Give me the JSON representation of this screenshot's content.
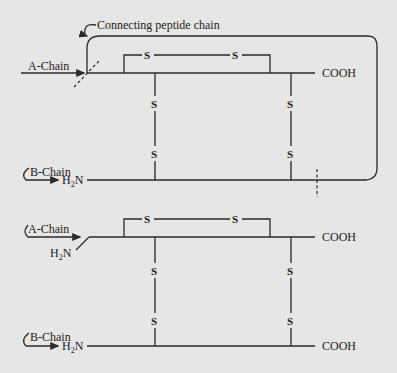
{
  "diagram": {
    "colors": {
      "background": "#e6e6e4",
      "ink": "#2a2a2a"
    },
    "top": {
      "connecting_label": "Connecting peptide chain",
      "a_chain_label": "A-Chain",
      "b_chain_label": "B-Chain",
      "a_chain_end": "COOH",
      "b_chain_start_h": "H",
      "b_chain_start_sub": "2",
      "b_chain_start_n": "N",
      "intra_s1": "S",
      "intra_s2": "S",
      "inter_left_top": "S",
      "inter_left_bottom": "S",
      "inter_right_top": "S",
      "inter_right_bottom": "S"
    },
    "bottom": {
      "a_chain_label": "A-Chain",
      "b_chain_label": "B-Chain",
      "a_chain_start_h": "H",
      "a_chain_start_sub": "2",
      "a_chain_start_n": "N",
      "a_chain_end": "COOH",
      "b_chain_start_h": "H",
      "b_chain_start_sub": "2",
      "b_chain_start_n": "N",
      "b_chain_end": "COOH",
      "intra_s1": "S",
      "intra_s2": "S",
      "inter_left_top": "S",
      "inter_left_bottom": "S",
      "inter_right_top": "S",
      "inter_right_bottom": "S"
    }
  }
}
